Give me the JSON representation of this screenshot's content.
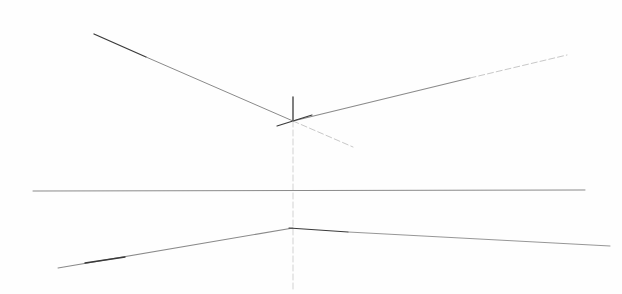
{
  "drawing": {
    "description": "Pencil perspective sketch with construction lines",
    "width": 622,
    "height": 294,
    "background": "#fefefe",
    "stroke_dark": "#3a3a3a",
    "stroke_mid": "#8a8a8a",
    "stroke_light": "#c8c8c8",
    "lines": [
      {
        "name": "upper-left-receding-line-dark",
        "x1": 94,
        "y1": 34,
        "x2": 146,
        "y2": 57,
        "tone": "dark",
        "w": 1.3
      },
      {
        "name": "upper-left-receding-line",
        "x1": 146,
        "y1": 57,
        "x2": 293,
        "y2": 121,
        "tone": "mid",
        "w": 1
      },
      {
        "name": "upper-left-extension-faint",
        "x1": 293,
        "y1": 121,
        "x2": 353,
        "y2": 147,
        "tone": "light",
        "w": 1
      },
      {
        "name": "upper-right-receding-line",
        "x1": 293,
        "y1": 121,
        "x2": 470,
        "y2": 78,
        "tone": "mid",
        "w": 1.1
      },
      {
        "name": "upper-right-receding-line-faint",
        "x1": 470,
        "y1": 78,
        "x2": 567,
        "y2": 55,
        "tone": "light",
        "w": 1
      },
      {
        "name": "corner-stroke",
        "x1": 277,
        "y1": 126,
        "x2": 312,
        "y2": 115,
        "tone": "dark",
        "w": 1.2
      },
      {
        "name": "vertical-edge-tick",
        "x1": 293,
        "y1": 97,
        "x2": 293,
        "y2": 121,
        "tone": "dark",
        "w": 1.3
      },
      {
        "name": "vertical-construction-line",
        "x1": 293,
        "y1": 121,
        "x2": 293,
        "y2": 292,
        "tone": "light",
        "w": 0.8
      },
      {
        "name": "horizon-line",
        "x1": 33,
        "y1": 191,
        "x2": 585,
        "y2": 190,
        "tone": "mid",
        "w": 1
      },
      {
        "name": "lower-left-receding-line",
        "x1": 58,
        "y1": 268,
        "x2": 293,
        "y2": 228,
        "tone": "mid",
        "w": 1.1
      },
      {
        "name": "lower-left-receding-line-dark",
        "x1": 85,
        "y1": 263,
        "x2": 125,
        "y2": 257,
        "tone": "dark",
        "w": 1.3
      },
      {
        "name": "lower-right-receding-line-dark",
        "x1": 289,
        "y1": 228,
        "x2": 348,
        "y2": 232,
        "tone": "dark",
        "w": 1.2
      },
      {
        "name": "lower-right-receding-line",
        "x1": 348,
        "y1": 232,
        "x2": 610,
        "y2": 246,
        "tone": "mid",
        "w": 0.9
      }
    ]
  }
}
